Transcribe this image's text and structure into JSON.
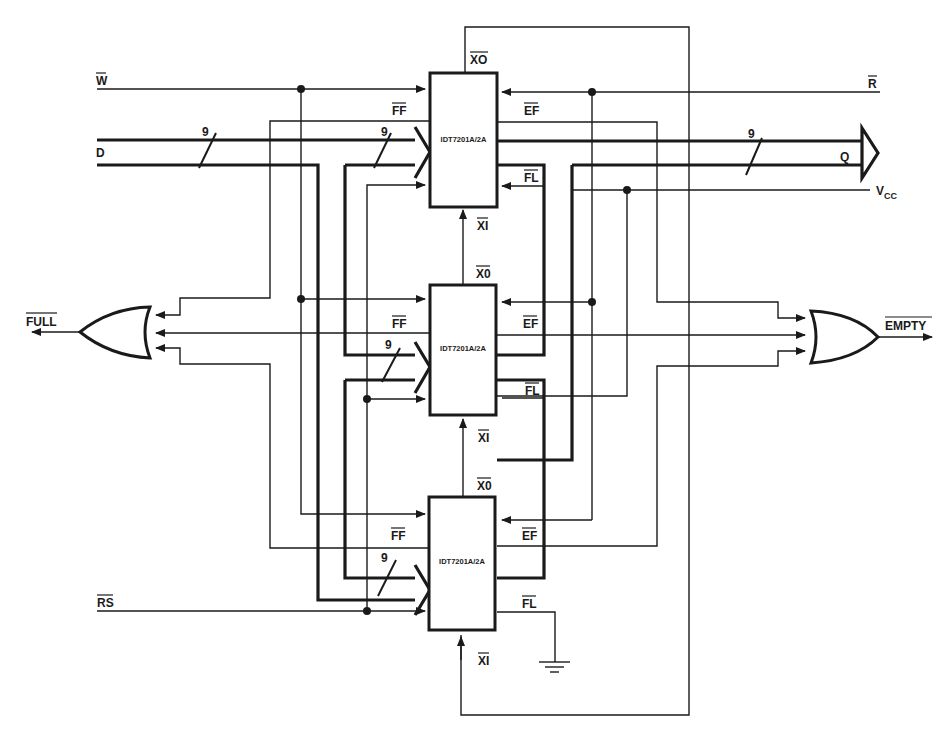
{
  "diagram": {
    "type": "schematic",
    "chips": [
      {
        "id": "fifo-top",
        "label": "IDT7201A/2A",
        "xo_label": "XO",
        "xi_label": "XI",
        "ff_label": "FF",
        "ef_label": "EF",
        "fl_label": "FL"
      },
      {
        "id": "fifo-middle",
        "label": "IDT7201A/2A",
        "xo_label": "X0",
        "xi_label": "XI",
        "ff_label": "FF",
        "ef_label": "EF",
        "fl_label": "FL"
      },
      {
        "id": "fifo-bottom",
        "label": "IDT7201A/2A",
        "xo_label": "X0",
        "xi_label": "XI",
        "ff_label": "FF",
        "ef_label": "EF",
        "fl_label": "FL"
      }
    ],
    "signals": {
      "write": "W",
      "read": "R",
      "data_in": "D",
      "data_out": "Q",
      "vcc": "V",
      "vcc_sub": "CC",
      "reset": "RS",
      "full": "FULL",
      "empty": "EMPTY"
    },
    "bus_width_labels": [
      "9",
      "9",
      "9",
      "9",
      "9"
    ],
    "gates": [
      {
        "id": "or-full",
        "type": "OR",
        "inputs": 3,
        "output": "FULL"
      },
      {
        "id": "or-empty",
        "type": "OR",
        "inputs": 3,
        "output": "EMPTY"
      }
    ],
    "ground": "GND"
  }
}
